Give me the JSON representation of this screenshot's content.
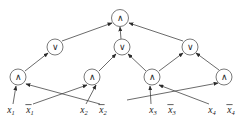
{
  "figure": {
    "name": "boolean-circuit-diagram",
    "width": 244,
    "height": 125,
    "background_color": "#ffffff",
    "edge_color": "#3a3a3a",
    "node_stroke_color": "#6b6b6b",
    "node_fill_color": "#ffffff",
    "text_color": "#1a1a1a"
  },
  "glyphs": {
    "and": "∧",
    "or": "∨"
  },
  "nodes": [
    {
      "id": "top-and",
      "label": "∧",
      "kind": "and-gate",
      "cx": 120,
      "cy": 18,
      "r": 8.5,
      "row": 0
    },
    {
      "id": "or-1",
      "label": "∨",
      "kind": "or-gate",
      "cx": 55,
      "cy": 47,
      "r": 8.0,
      "row": 1
    },
    {
      "id": "or-2",
      "label": "∨",
      "kind": "or-gate",
      "cx": 122,
      "cy": 47,
      "r": 8.0,
      "row": 1
    },
    {
      "id": "or-3",
      "label": "∨",
      "kind": "or-gate",
      "cx": 190,
      "cy": 47,
      "r": 8.0,
      "row": 1
    },
    {
      "id": "and-1",
      "label": "∧",
      "kind": "and-gate",
      "cx": 18,
      "cy": 77,
      "r": 8.0,
      "row": 2
    },
    {
      "id": "and-2",
      "label": "∧",
      "kind": "and-gate",
      "cx": 92,
      "cy": 77,
      "r": 8.0,
      "row": 2
    },
    {
      "id": "and-3",
      "label": "∧",
      "kind": "and-gate",
      "cx": 152,
      "cy": 77,
      "r": 8.0,
      "row": 2
    },
    {
      "id": "and-4",
      "label": "∧",
      "kind": "and-gate",
      "cx": 224,
      "cy": 77,
      "r": 8.0,
      "row": 2
    }
  ],
  "literals": [
    {
      "id": "lit-x1",
      "base": "x",
      "sub": "1",
      "negated": false,
      "x": 11,
      "y": 113
    },
    {
      "id": "lit-not-x1",
      "base": "x",
      "sub": "1",
      "negated": true,
      "x": 30,
      "y": 113
    },
    {
      "id": "lit-x2",
      "base": "x",
      "sub": "2",
      "negated": false,
      "x": 84,
      "y": 113
    },
    {
      "id": "lit-not-x2",
      "base": "x",
      "sub": "2",
      "negated": true,
      "x": 103,
      "y": 113
    },
    {
      "id": "lit-x3",
      "base": "x",
      "sub": "3",
      "negated": false,
      "x": 153,
      "y": 113
    },
    {
      "id": "lit-not-x3",
      "base": "x",
      "sub": "3",
      "negated": true,
      "x": 172,
      "y": 113
    },
    {
      "id": "lit-x4",
      "base": "x",
      "sub": "4",
      "negated": false,
      "x": 212,
      "y": 113
    },
    {
      "id": "lit-not-x4",
      "base": "x",
      "sub": "4",
      "negated": true,
      "x": 231,
      "y": 113
    }
  ],
  "edges": [
    {
      "id": "e-or1-top",
      "from": "or-1",
      "to": "top-and",
      "x1": 62,
      "y1": 41,
      "x2": 112,
      "y2": 23
    },
    {
      "id": "e-or2-top",
      "from": "or-2",
      "to": "top-and",
      "x1": 121,
      "y1": 39,
      "x2": 120,
      "y2": 27
    },
    {
      "id": "e-or3-top",
      "from": "or-3",
      "to": "top-and",
      "x1": 183,
      "y1": 41,
      "x2": 129,
      "y2": 23
    },
    {
      "id": "e-and1-or1",
      "from": "and-1",
      "to": "or-1",
      "x1": 25,
      "y1": 71,
      "x2": 48,
      "y2": 53
    },
    {
      "id": "e-and2-or2",
      "from": "and-2",
      "to": "or-2",
      "x1": 99,
      "y1": 71,
      "x2": 116,
      "y2": 54
    },
    {
      "id": "e-and3-or2",
      "from": "and-3",
      "to": "or-2",
      "x1": 146,
      "y1": 71,
      "x2": 128,
      "y2": 54
    },
    {
      "id": "e-and3-or3",
      "from": "and-3",
      "to": "or-3",
      "x1": 159,
      "y1": 71,
      "x2": 183,
      "y2": 53
    },
    {
      "id": "e-and4-or3",
      "from": "and-4",
      "to": "or-3",
      "x1": 219,
      "y1": 70,
      "x2": 196,
      "y2": 53
    },
    {
      "id": "e-x1-and1",
      "from": "lit-x1",
      "to": "and-1",
      "x1": 13,
      "y1": 104,
      "x2": 16,
      "y2": 86
    },
    {
      "id": "e-notx2-and1",
      "from": "lit-not-x2",
      "to": "and-1",
      "x1": 100,
      "y1": 104,
      "x2": 26,
      "y2": 84
    },
    {
      "id": "e-notx1-and2",
      "from": "lit-not-x1",
      "to": "and-2",
      "x1": 33,
      "y1": 104,
      "x2": 87,
      "y2": 85
    },
    {
      "id": "e-x2-and2",
      "from": "lit-x2",
      "to": "and-2",
      "x1": 86,
      "y1": 104,
      "x2": 96,
      "y2": 85
    },
    {
      "id": "e-x3-and3",
      "from": "lit-x3",
      "to": "and-3",
      "x1": 151,
      "y1": 104,
      "x2": 150,
      "y2": 86
    },
    {
      "id": "e-x4-and3",
      "from": "lit-x4",
      "to": "and-3",
      "x1": 209,
      "y1": 104,
      "x2": 159,
      "y2": 85
    },
    {
      "id": "e-notx3-and4",
      "from": "lit-not-x3",
      "to": "and-4",
      "x1": 127,
      "y1": 100,
      "x2": 218,
      "y2": 83
    }
  ]
}
